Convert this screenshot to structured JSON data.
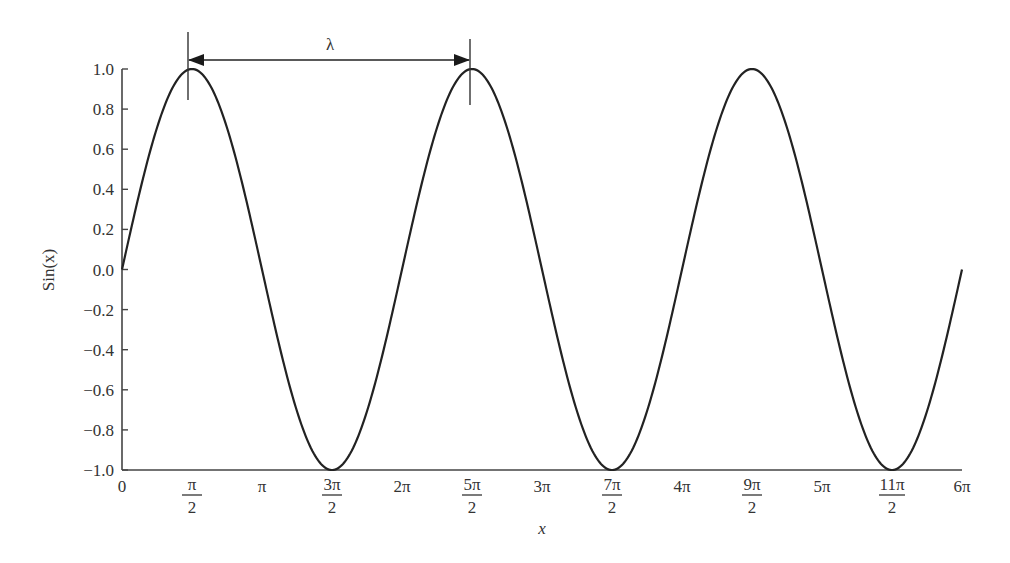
{
  "chart_data": {
    "type": "line",
    "title": "",
    "xlabel": "x",
    "ylabel": "Sin(x)",
    "xlim": [
      0,
      18.8496
    ],
    "ylim": [
      -1.0,
      1.0
    ],
    "grid": false,
    "legend": null,
    "series": [
      {
        "name": "sin(x)",
        "function": "sin(x)",
        "x_range_pi": [
          0,
          6
        ],
        "color": "#222222"
      }
    ],
    "x_ticks": [
      {
        "value_pi": 0,
        "label": "0"
      },
      {
        "value_pi": 0.5,
        "label_num": "π",
        "label_den": "2"
      },
      {
        "value_pi": 1,
        "label": "π"
      },
      {
        "value_pi": 1.5,
        "label_num": "3π",
        "label_den": "2"
      },
      {
        "value_pi": 2,
        "label": "2π"
      },
      {
        "value_pi": 2.5,
        "label_num": "5π",
        "label_den": "2"
      },
      {
        "value_pi": 3,
        "label": "3π"
      },
      {
        "value_pi": 3.5,
        "label_num": "7π",
        "label_den": "2"
      },
      {
        "value_pi": 4,
        "label": "4π"
      },
      {
        "value_pi": 4.5,
        "label_num": "9π",
        "label_den": "2"
      },
      {
        "value_pi": 5,
        "label": "5π"
      },
      {
        "value_pi": 5.5,
        "label_num": "11π",
        "label_den": "2"
      },
      {
        "value_pi": 6,
        "label": "6π"
      }
    ],
    "y_ticks": [
      {
        "value": 1.0,
        "label": "1.0"
      },
      {
        "value": 0.8,
        "label": "0.8"
      },
      {
        "value": 0.6,
        "label": "0.6"
      },
      {
        "value": 0.4,
        "label": "0.4"
      },
      {
        "value": 0.2,
        "label": "0.2"
      },
      {
        "value": 0.0,
        "label": "0.0"
      },
      {
        "value": -0.2,
        "label": "−0.2"
      },
      {
        "value": -0.4,
        "label": "−0.4"
      },
      {
        "value": -0.6,
        "label": "−0.6"
      },
      {
        "value": -0.8,
        "label": "−0.8"
      },
      {
        "value": -1.0,
        "label": "−1.0"
      }
    ],
    "annotations": [
      {
        "type": "dimension-arrow",
        "label": "λ",
        "from_x_pi": 0.5,
        "to_x_pi": 2.5,
        "description": "wavelength between successive peaks"
      }
    ]
  },
  "labels": {
    "x_axis": "x",
    "y_axis": "Sin(x)",
    "wavelength": "λ"
  }
}
